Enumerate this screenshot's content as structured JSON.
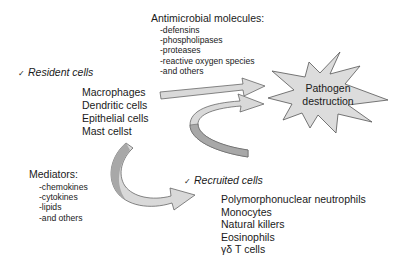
{
  "antimicrobial": {
    "title": "Antimicrobial molecules:",
    "items": [
      "-defensins",
      "-phospholipases",
      "-proteases",
      "-reactive oxygen species",
      "-and others"
    ]
  },
  "resident": {
    "check": "✓",
    "title": "Resident cells",
    "cells": [
      "Macrophages",
      "Dendritic cells",
      "Epithelial cells",
      "Mast cellst"
    ]
  },
  "target": {
    "line1": "Pathogen",
    "line2": "destruction"
  },
  "mediators": {
    "title": "Mediators:",
    "items": [
      "-chemokines",
      "-cytokines",
      "-lipids",
      "-and others"
    ]
  },
  "recruited": {
    "check": "✓",
    "title": "Recruited cells",
    "cells": [
      "Polymorphonuclear neutrophils",
      "Monocytes",
      "Natural killers",
      "Eosinophils",
      "γδ T cells"
    ]
  },
  "colors": {
    "arrow_fill": "#d9d9d9",
    "arrow_dark": "#a8a8a8",
    "star_fill": "#dcdcdc",
    "stroke": "#555555",
    "text": "#1a1a1a"
  }
}
